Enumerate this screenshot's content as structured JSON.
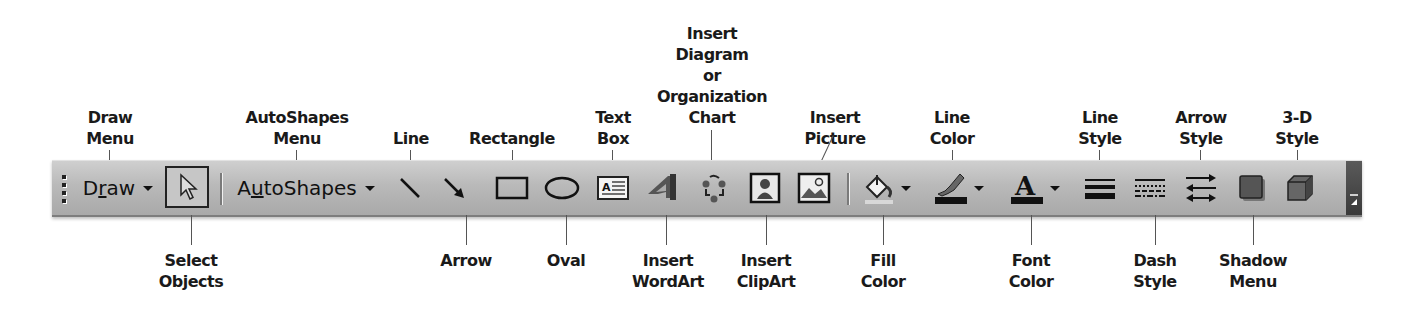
{
  "toolbar": {
    "draw_label_pre": "D",
    "draw_label_u": "r",
    "draw_label_post": "aw",
    "autoshapes_label_pre": "A",
    "autoshapes_label_u": "u",
    "autoshapes_label_post": "toShapes",
    "items": [
      {
        "name": "draw-menu",
        "icon": "draw-text-dropdown"
      },
      {
        "name": "select-objects",
        "icon": "pointer-arrow-icon"
      },
      {
        "name": "autoshapes-menu",
        "icon": "autoshapes-text-dropdown"
      },
      {
        "name": "line",
        "icon": "line-icon"
      },
      {
        "name": "arrow",
        "icon": "arrow-icon"
      },
      {
        "name": "rectangle",
        "icon": "rectangle-icon"
      },
      {
        "name": "oval",
        "icon": "oval-icon"
      },
      {
        "name": "text-box",
        "icon": "text-box-icon"
      },
      {
        "name": "insert-wordart",
        "icon": "wordart-icon"
      },
      {
        "name": "insert-diagram",
        "icon": "diagram-cycle-icon"
      },
      {
        "name": "insert-clipart",
        "icon": "clipart-icon"
      },
      {
        "name": "insert-picture",
        "icon": "picture-icon"
      },
      {
        "name": "fill-color",
        "icon": "paint-bucket-icon"
      },
      {
        "name": "line-color",
        "icon": "paintbrush-icon"
      },
      {
        "name": "font-color",
        "icon": "font-color-a-icon"
      },
      {
        "name": "line-style",
        "icon": "line-weight-icon"
      },
      {
        "name": "dash-style",
        "icon": "dash-lines-icon"
      },
      {
        "name": "arrow-style",
        "icon": "arrow-direction-icon"
      },
      {
        "name": "shadow-style",
        "icon": "shadow-square-icon"
      },
      {
        "name": "3d-style",
        "icon": "cube-icon"
      },
      {
        "name": "toolbar-options",
        "icon": "toolbar-options-icon"
      }
    ],
    "colors": {
      "toolbar_bg": "#b9b9b9",
      "line_color_swatch": "#111111",
      "font_color_swatch": "#111111",
      "fill_color_swatch": "#d8d8d8"
    }
  },
  "callouts_top": {
    "draw_menu": "Draw\nMenu",
    "autoshapes_menu": "AutoShapes\nMenu",
    "line": "Line",
    "rectangle": "Rectangle",
    "text_box": "Text\nBox",
    "insert_diagram": "Insert\nDiagram\nor\nOrganization\nChart",
    "insert_picture": "Insert\nPicture",
    "line_color": "Line\nColor",
    "line_style": "Line\nStyle",
    "arrow_style": "Arrow\nStyle",
    "3d_style": "3-D\nStyle"
  },
  "callouts_bottom": {
    "select_objects": "Select\nObjects",
    "arrow": "Arrow",
    "oval": "Oval",
    "insert_wordart": "Insert\nWordArt",
    "insert_clipart": "Insert\nClipArt",
    "fill_color": "Fill\nColor",
    "font_color": "Font\nColor",
    "dash_style": "Dash\nStyle",
    "shadow_menu": "Shadow\nMenu"
  }
}
